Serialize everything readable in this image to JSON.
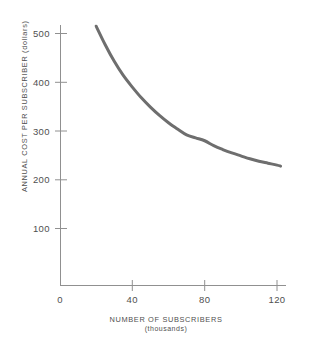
{
  "chart_data": {
    "type": "line",
    "title": "",
    "xlabel": "NUMBER OF SUBSCRIBERS",
    "xlabel_sub": "(thousands)",
    "ylabel": "ANNUAL COST PER SUBSCRIBER (dollars)",
    "xlim": [
      0,
      125
    ],
    "ylim": [
      0,
      540
    ],
    "grid": false,
    "legend": "none",
    "xticks": [
      0,
      40,
      80,
      120
    ],
    "xtick_labels": [
      "0",
      "40",
      "80",
      "120"
    ],
    "yticks": [
      100,
      200,
      300,
      400,
      500
    ],
    "ytick_labels": [
      "100",
      "200",
      "300",
      "400",
      "500"
    ],
    "series": [
      {
        "name": "Annual cost per subscriber",
        "color": "#6e6e6e",
        "linewidth": 3,
        "x": [
          20,
          25,
          30,
          35,
          40,
          45,
          50,
          55,
          60,
          65,
          70,
          75,
          80,
          85,
          90,
          95,
          100,
          105,
          110,
          115,
          120,
          122
        ],
        "values": [
          515,
          477,
          443,
          414,
          390,
          368,
          349,
          332,
          317,
          304,
          292,
          286,
          280,
          270,
          262,
          255,
          249,
          243,
          238,
          234,
          230,
          228
        ]
      }
    ],
    "annotations": []
  },
  "axes": {
    "x_axis_name": "x-axis",
    "y_axis_name": "y-axis"
  }
}
